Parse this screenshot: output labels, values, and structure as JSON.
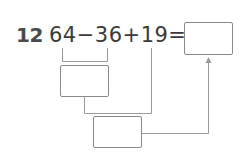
{
  "problem": {
    "number": "12",
    "expression": "64−36+19=",
    "terms": [
      "64",
      "36",
      "19"
    ],
    "operators": [
      "−",
      "+",
      "="
    ]
  },
  "boxes": {
    "answer": "",
    "step1": "",
    "step2": ""
  },
  "colors": {
    "text": "#3a3a3a",
    "lines": "#9a9a9a"
  }
}
